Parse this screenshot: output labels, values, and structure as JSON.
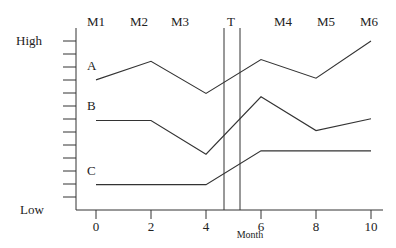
{
  "chart_data": {
    "type": "line",
    "title": "",
    "xlabel": "Month",
    "ylabel": "",
    "y_axis_labels": {
      "top": "High",
      "bottom": "Low"
    },
    "x": [
      0,
      2,
      4,
      6,
      8,
      10
    ],
    "x_tick_labels": [
      "0",
      "2",
      "4",
      "6",
      "8",
      "10"
    ],
    "top_labels": [
      "M1",
      "M2",
      "M3",
      "T",
      "M4",
      "M5",
      "M6"
    ],
    "marker": {
      "label": "T",
      "x_range": [
        5.2,
        5.9
      ]
    },
    "ylim": [
      0,
      100
    ],
    "y_tick_count": 13,
    "grid": false,
    "legend_position": "inline-left",
    "series": [
      {
        "name": "A",
        "x": [
          0,
          2,
          4,
          6,
          8,
          10
        ],
        "values": [
          77,
          88,
          69,
          89,
          78,
          100
        ]
      },
      {
        "name": "B",
        "x": [
          0,
          2,
          4,
          6,
          8,
          10
        ],
        "values": [
          53,
          53,
          33,
          67,
          47,
          54
        ]
      },
      {
        "name": "C",
        "x": [
          0,
          4,
          6,
          10
        ],
        "values": [
          15,
          15,
          35,
          35
        ]
      }
    ]
  }
}
